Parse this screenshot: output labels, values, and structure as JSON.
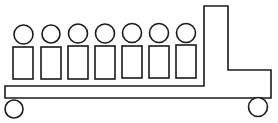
{
  "diagram": {
    "title": "",
    "stroke_color": "#1a1a1a",
    "fill_color": "#ffffff",
    "vehicle": {
      "body_outline": "5,86 204,86 204,6 228,6 228,70 271,70 271,98 5,98",
      "wheels": [
        {
          "cx": 14,
          "cy": 109,
          "r": 9
        },
        {
          "cx": 258,
          "cy": 107,
          "r": 9.5
        }
      ]
    },
    "figures": [
      {
        "head": {
          "cx": 23.5,
          "cy": 34.5,
          "r": 9.5
        },
        "body": {
          "x": 13,
          "y": 47,
          "w": 20,
          "h": 32
        }
      },
      {
        "head": {
          "cx": 51,
          "cy": 34,
          "r": 9
        },
        "body": {
          "x": 41,
          "y": 47,
          "w": 20,
          "h": 32
        }
      },
      {
        "head": {
          "cx": 78,
          "cy": 33.5,
          "r": 9.5
        },
        "body": {
          "x": 68,
          "y": 46,
          "w": 20,
          "h": 33
        }
      },
      {
        "head": {
          "cx": 105,
          "cy": 33.5,
          "r": 9.5
        },
        "body": {
          "x": 95,
          "y": 46,
          "w": 20,
          "h": 33
        }
      },
      {
        "head": {
          "cx": 132,
          "cy": 33,
          "r": 9.5
        },
        "body": {
          "x": 122,
          "y": 46,
          "w": 20,
          "h": 32
        }
      },
      {
        "head": {
          "cx": 159,
          "cy": 33,
          "r": 9.5
        },
        "body": {
          "x": 149,
          "y": 46,
          "w": 20,
          "h": 32
        }
      },
      {
        "head": {
          "cx": 186,
          "cy": 33,
          "r": 9.5
        },
        "body": {
          "x": 176,
          "y": 45,
          "w": 20,
          "h": 33
        }
      }
    ]
  }
}
